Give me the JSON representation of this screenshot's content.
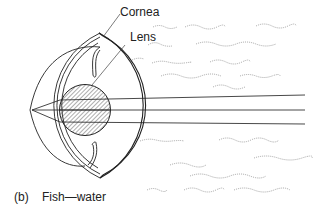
{
  "figure": {
    "labels": {
      "cornea": "Cornea",
      "lens": "Lens"
    },
    "caption": {
      "marker": "(b)",
      "text": "Fish—water"
    },
    "colors": {
      "line": "#222222",
      "water": "#999999",
      "background": "#ffffff"
    }
  }
}
